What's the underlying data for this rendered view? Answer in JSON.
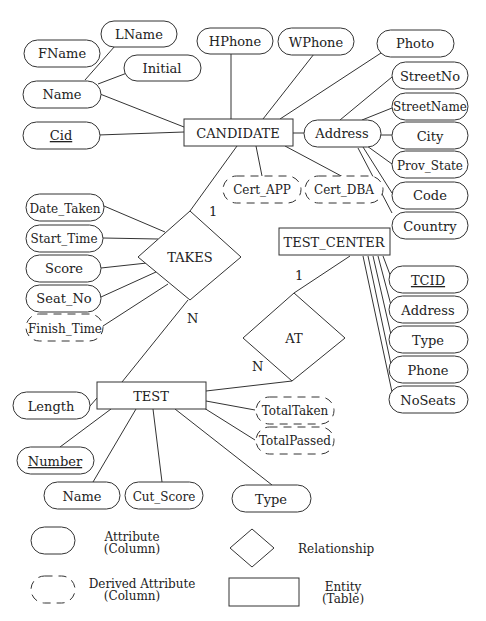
{
  "entities": {
    "candidate": "CANDIDATE",
    "test_center": "TEST_CENTER",
    "test": "TEST"
  },
  "relationships": {
    "takes": "TAKES",
    "at": "AT"
  },
  "cardinality": {
    "takes_candidate": "1",
    "takes_test": "N",
    "at_test_center": "1",
    "at_test": "N"
  },
  "candidate_attributes": {
    "fname": "FName",
    "lname": "LName",
    "initial": "Initial",
    "name": "Name",
    "cid": "Cid",
    "hphone": "HPhone",
    "wphone": "WPhone",
    "photo": "Photo",
    "address": "Address",
    "street_no": "StreetNo",
    "street_name": "StreetName",
    "city": "City",
    "prov_state": "Prov_State",
    "code": "Code",
    "country": "Country",
    "cert_app": "Cert_APP",
    "cert_dba": "Cert_DBA"
  },
  "takes_attributes": {
    "date_taken": "Date_Taken",
    "start_time": "Start_Time",
    "score": "Score",
    "seat_no": "Seat_No",
    "finish_time": "Finish_Time"
  },
  "test_center_attributes": {
    "tcid": "TCID",
    "address": "Address",
    "type": "Type",
    "phone": "Phone",
    "noseats": "NoSeats"
  },
  "test_attributes": {
    "length": "Length",
    "number": "Number",
    "name": "Name",
    "cut_score": "Cut_Score",
    "type": "Type",
    "total_taken": "TotalTaken",
    "total_passed": "TotalPassed"
  },
  "legend": {
    "attribute_line1": "Attribute",
    "attribute_line2": "(Column)",
    "relationship": "Relationship",
    "derived_line1": "Derived Attribute",
    "derived_line2": "(Column)",
    "entity_line1": "Entity",
    "entity_line2": "(Table)"
  }
}
